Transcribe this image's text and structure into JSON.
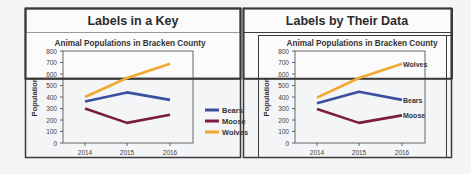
{
  "panels": [
    {
      "title": "Labels in a Key",
      "label_style": "legend"
    },
    {
      "title": "Labels by Their Data",
      "label_style": "direct"
    }
  ],
  "chart_data": [
    {
      "type": "line",
      "title": "Animal Populations in Bracken County",
      "xlabel": "",
      "ylabel": "Population",
      "categories": [
        "2014",
        "2015",
        "2016"
      ],
      "yticks": [
        0,
        100,
        200,
        300,
        400,
        500,
        600,
        700,
        800
      ],
      "ylim": [
        0,
        800
      ],
      "grid": false,
      "legend_position": "right",
      "series": [
        {
          "name": "Bears",
          "color": "#3b4fa0",
          "values": [
            360,
            440,
            375
          ]
        },
        {
          "name": "Moose",
          "color": "#7a1d3f",
          "values": [
            300,
            175,
            245
          ]
        },
        {
          "name": "Wolves",
          "color": "#f0a830",
          "values": [
            400,
            565,
            690
          ]
        }
      ]
    },
    {
      "type": "line",
      "title": "Animal Populations in Bracken County",
      "xlabel": "",
      "ylabel": "Population",
      "categories": [
        "2014",
        "2015",
        "2016"
      ],
      "yticks": [
        0,
        100,
        200,
        300,
        400,
        500,
        600,
        700,
        800
      ],
      "ylim": [
        0,
        800
      ],
      "grid": false,
      "legend_position": "none (labels at line ends)",
      "series": [
        {
          "name": "Bears",
          "color": "#3b4fa0",
          "values": [
            345,
            445,
            375
          ]
        },
        {
          "name": "Moose",
          "color": "#7a1d3f",
          "values": [
            295,
            175,
            240
          ]
        },
        {
          "name": "Wolves",
          "color": "#f0a830",
          "values": [
            395,
            565,
            690
          ]
        }
      ]
    }
  ]
}
